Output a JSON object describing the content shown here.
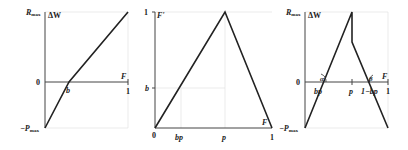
{
  "panels": [
    {
      "id": "left",
      "labels": {
        "y_top": "R",
        "y_top_sub": "max",
        "y_title": "ΔW",
        "y_zero": "0",
        "y_bottom": "−P",
        "y_bottom_sub": "max",
        "x_title": "F",
        "x_b": "b",
        "x_one": "1"
      }
    },
    {
      "id": "middle",
      "labels": {
        "y_top": "1",
        "y_title": "F'",
        "y_b": "b",
        "y_zero": "0",
        "x_bp": "bp",
        "x_p": "p",
        "x_one": "1",
        "x_title": "F"
      }
    },
    {
      "id": "right",
      "labels": {
        "y_top": "R",
        "y_top_sub": "max",
        "y_title": "ΔW",
        "y_zero": "0",
        "y_bottom": "−P",
        "y_bottom_sub": "max",
        "x_title": "F",
        "x_bp": "bp",
        "x_p": "p",
        "x_1mbp": "1−bp",
        "x_one": "1",
        "angle_alpha": "α",
        "angle_beta": "β"
      }
    }
  ]
}
